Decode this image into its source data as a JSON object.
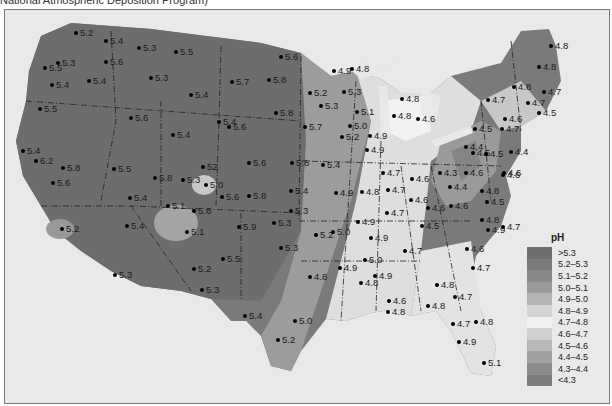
{
  "caption": "National Atmospheric Deposition Program)",
  "legend": {
    "title": "pH",
    "items": [
      {
        "label": ">5.3",
        "color": "#6e6e6e"
      },
      {
        "label": "5.2–5.3",
        "color": "#7a7a7a"
      },
      {
        "label": "5.1–5.2",
        "color": "#888888"
      },
      {
        "label": "5.0–5.1",
        "color": "#9a9a9a"
      },
      {
        "label": "4.9–5.0",
        "color": "#b4b4b4"
      },
      {
        "label": "4.8–4.9",
        "color": "#d4d4d4"
      },
      {
        "label": "4.7–4.8",
        "color": "#f0f0f0"
      },
      {
        "label": "4.6–4.7",
        "color": "#d0d0d0"
      },
      {
        "label": "4.5–4.6",
        "color": "#b8b8b8"
      },
      {
        "label": "4.4–4.5",
        "color": "#a0a0a0"
      },
      {
        "label": "4.3–4.4",
        "color": "#8c8c8c"
      },
      {
        "label": "<4.3",
        "color": "#7c7c7c"
      }
    ]
  },
  "points": [
    {
      "v": "5.2",
      "x": 73,
      "y": 32
    },
    {
      "v": "5.4",
      "x": 103,
      "y": 40
    },
    {
      "v": "5.3",
      "x": 136,
      "y": 47
    },
    {
      "v": "5.5",
      "x": 173,
      "y": 51
    },
    {
      "v": "5.5",
      "x": 42,
      "y": 67
    },
    {
      "v": "5.3",
      "x": 55,
      "y": 62
    },
    {
      "v": "5.6",
      "x": 103,
      "y": 61
    },
    {
      "v": "5.4",
      "x": 49,
      "y": 84
    },
    {
      "v": "5.4",
      "x": 86,
      "y": 80
    },
    {
      "v": "5.3",
      "x": 148,
      "y": 77
    },
    {
      "v": "5.4",
      "x": 188,
      "y": 94
    },
    {
      "v": "5.6",
      "x": 128,
      "y": 117
    },
    {
      "v": "5.5",
      "x": 37,
      "y": 108
    },
    {
      "v": "5.7",
      "x": 229,
      "y": 81
    },
    {
      "v": "5.8",
      "x": 266,
      "y": 79
    },
    {
      "v": "5.6",
      "x": 278,
      "y": 56
    },
    {
      "v": "5.8",
      "x": 273,
      "y": 112
    },
    {
      "v": "5.4",
      "x": 216,
      "y": 121
    },
    {
      "v": "5.6",
      "x": 226,
      "y": 126
    },
    {
      "v": "5.4",
      "x": 170,
      "y": 134
    },
    {
      "v": "5.4",
      "x": 20,
      "y": 150
    },
    {
      "v": "6.2",
      "x": 33,
      "y": 160
    },
    {
      "v": "5.8",
      "x": 60,
      "y": 167
    },
    {
      "v": "5.6",
      "x": 50,
      "y": 182
    },
    {
      "v": "5.5",
      "x": 111,
      "y": 168
    },
    {
      "v": "5.8",
      "x": 152,
      "y": 177
    },
    {
      "v": "5.4",
      "x": 127,
      "y": 197
    },
    {
      "v": "5.4",
      "x": 124,
      "y": 225
    },
    {
      "v": "5.2",
      "x": 59,
      "y": 228
    },
    {
      "v": "5.3",
      "x": 112,
      "y": 274
    },
    {
      "v": "52",
      "x": 200,
      "y": 166
    },
    {
      "v": "5.3",
      "x": 180,
      "y": 179
    },
    {
      "v": "5.0",
      "x": 203,
      "y": 184
    },
    {
      "v": "5.6",
      "x": 219,
      "y": 196
    },
    {
      "v": "5.1",
      "x": 165,
      "y": 205
    },
    {
      "v": "5.6",
      "x": 191,
      "y": 210
    },
    {
      "v": "5.1",
      "x": 184,
      "y": 231
    },
    {
      "v": "5.8",
      "x": 246,
      "y": 195
    },
    {
      "v": "5.9",
      "x": 236,
      "y": 226
    },
    {
      "v": "5.5",
      "x": 220,
      "y": 258
    },
    {
      "v": "5.2",
      "x": 191,
      "y": 268
    },
    {
      "v": "5.3",
      "x": 199,
      "y": 289
    },
    {
      "v": "5.6",
      "x": 246,
      "y": 162
    },
    {
      "v": "5.8",
      "x": 289,
      "y": 162
    },
    {
      "v": "5.4",
      "x": 288,
      "y": 190
    },
    {
      "v": "5.3",
      "x": 288,
      "y": 210
    },
    {
      "v": "5.3",
      "x": 271,
      "y": 222
    },
    {
      "v": "5.3",
      "x": 278,
      "y": 247
    },
    {
      "v": "5.4",
      "x": 242,
      "y": 315
    },
    {
      "v": "5.0",
      "x": 292,
      "y": 320
    },
    {
      "v": "5.2",
      "x": 275,
      "y": 339
    },
    {
      "v": "5.2",
      "x": 307,
      "y": 92
    },
    {
      "v": "5.3",
      "x": 318,
      "y": 105
    },
    {
      "v": "5.7",
      "x": 302,
      "y": 126
    },
    {
      "v": "5.4",
      "x": 320,
      "y": 164
    },
    {
      "v": "4.9",
      "x": 331,
      "y": 70
    },
    {
      "v": "4.8",
      "x": 349,
      "y": 68
    },
    {
      "v": "5.3",
      "x": 341,
      "y": 91
    },
    {
      "v": "5.1",
      "x": 354,
      "y": 111
    },
    {
      "v": "5.0",
      "x": 347,
      "y": 125
    },
    {
      "v": "5.2",
      "x": 339,
      "y": 136
    },
    {
      "v": "4.9",
      "x": 367,
      "y": 135
    },
    {
      "v": "4.9",
      "x": 364,
      "y": 149
    },
    {
      "v": "4.8",
      "x": 399,
      "y": 98
    },
    {
      "v": "4.8",
      "x": 391,
      "y": 115
    },
    {
      "v": "4.6",
      "x": 415,
      "y": 118
    },
    {
      "v": "4.9",
      "x": 333,
      "y": 192
    },
    {
      "v": "4.8",
      "x": 359,
      "y": 191
    },
    {
      "v": "4.7",
      "x": 380,
      "y": 172
    },
    {
      "v": "4.7",
      "x": 385,
      "y": 189
    },
    {
      "v": "4.7",
      "x": 384,
      "y": 212
    },
    {
      "v": "4.6",
      "x": 409,
      "y": 178
    },
    {
      "v": "4.6",
      "x": 408,
      "y": 199
    },
    {
      "v": "4.6",
      "x": 425,
      "y": 207
    },
    {
      "v": "4.3",
      "x": 437,
      "y": 172
    },
    {
      "v": "4.4",
      "x": 447,
      "y": 186
    },
    {
      "v": "4.6",
      "x": 448,
      "y": 205
    },
    {
      "v": "4.5",
      "x": 419,
      "y": 225
    },
    {
      "v": "4.9",
      "x": 355,
      "y": 221
    },
    {
      "v": "5.2",
      "x": 313,
      "y": 234
    },
    {
      "v": "5.0",
      "x": 330,
      "y": 231
    },
    {
      "v": "4.9",
      "x": 368,
      "y": 237
    },
    {
      "v": "5.0",
      "x": 362,
      "y": 259
    },
    {
      "v": "4.9",
      "x": 337,
      "y": 267
    },
    {
      "v": "4.9",
      "x": 372,
      "y": 275
    },
    {
      "v": "4.8",
      "x": 307,
      "y": 276
    },
    {
      "v": "4.7",
      "x": 402,
      "y": 250
    },
    {
      "v": "4.8",
      "x": 358,
      "y": 282
    },
    {
      "v": "4.6",
      "x": 386,
      "y": 300
    },
    {
      "v": "4.8",
      "x": 385,
      "y": 311
    },
    {
      "v": "4.8",
      "x": 434,
      "y": 284
    },
    {
      "v": "4.7",
      "x": 452,
      "y": 296
    },
    {
      "v": "4.8",
      "x": 425,
      "y": 305
    },
    {
      "v": "4.7",
      "x": 450,
      "y": 323
    },
    {
      "v": "4.8",
      "x": 473,
      "y": 321
    },
    {
      "v": "4.9",
      "x": 456,
      "y": 341
    },
    {
      "v": "5.1",
      "x": 481,
      "y": 362
    },
    {
      "v": "4.5",
      "x": 470,
      "y": 152
    },
    {
      "v": "4.6",
      "x": 500,
      "y": 174
    },
    {
      "v": "4.8",
      "x": 479,
      "y": 190
    },
    {
      "v": "4.5",
      "x": 484,
      "y": 201
    },
    {
      "v": "4.8",
      "x": 479,
      "y": 219
    },
    {
      "v": "4.9",
      "x": 485,
      "y": 229
    },
    {
      "v": "4.7",
      "x": 500,
      "y": 226
    },
    {
      "v": "4.6",
      "x": 464,
      "y": 248
    },
    {
      "v": "4.7",
      "x": 470,
      "y": 267
    },
    {
      "v": "4.6",
      "x": 463,
      "y": 172
    },
    {
      "v": "4.5",
      "x": 472,
      "y": 128
    },
    {
      "v": "4.4",
      "x": 463,
      "y": 146
    },
    {
      "v": "4.5",
      "x": 483,
      "y": 153
    },
    {
      "v": "4.4",
      "x": 508,
      "y": 151
    },
    {
      "v": "4.6",
      "x": 501,
      "y": 172
    },
    {
      "v": "4.6",
      "x": 502,
      "y": 118
    },
    {
      "v": "4.7",
      "x": 499,
      "y": 128
    },
    {
      "v": "4.5",
      "x": 536,
      "y": 112
    },
    {
      "v": "4.7",
      "x": 485,
      "y": 99
    },
    {
      "v": "4.7",
      "x": 525,
      "y": 102
    },
    {
      "v": "4.7",
      "x": 541,
      "y": 91
    },
    {
      "v": "4.8",
      "x": 511,
      "y": 86
    },
    {
      "v": "4.8",
      "x": 536,
      "y": 66
    },
    {
      "v": "4.8",
      "x": 548,
      "y": 45
    }
  ]
}
